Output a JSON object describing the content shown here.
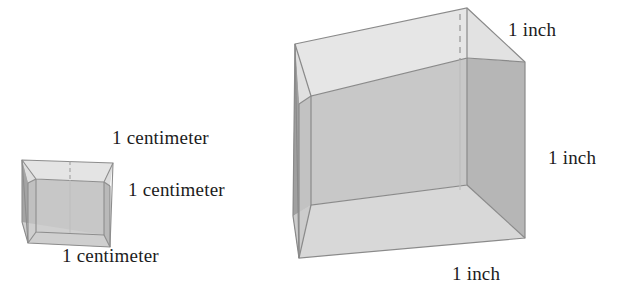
{
  "figure": {
    "background_color": "#ffffff",
    "palette": {
      "top_face": "#e3e3e3",
      "exterior_left_face": "#a6a6a6",
      "interior_back_wall": "#c6c6c6",
      "interior_right_wall": "#b4b4b4",
      "interior_floor": "#d6d6d6",
      "edge_stroke": "#8a8a8a",
      "dashed_stroke": "#9a9a9a",
      "text_color": "#1c1c1c"
    },
    "shapes": [
      {
        "name": "centimeter-cube",
        "kind": "open-cube",
        "unit": "centimeter",
        "edge_length_value": 1,
        "edge_length_text": "1 centimeter",
        "relative_scale": "small"
      },
      {
        "name": "inch-cube",
        "kind": "open-cube",
        "unit": "inch",
        "edge_length_value": 1,
        "edge_length_text": "1 inch",
        "relative_scale": "large"
      }
    ]
  },
  "labels": {
    "centimeter_cube": {
      "top_edge": "1 centimeter",
      "right_edge": "1 centimeter",
      "bottom_edge": "1 centimeter"
    },
    "inch_cube": {
      "top_edge": "1 inch",
      "right_edge": "1 inch",
      "bottom_edge": "1 inch"
    }
  }
}
